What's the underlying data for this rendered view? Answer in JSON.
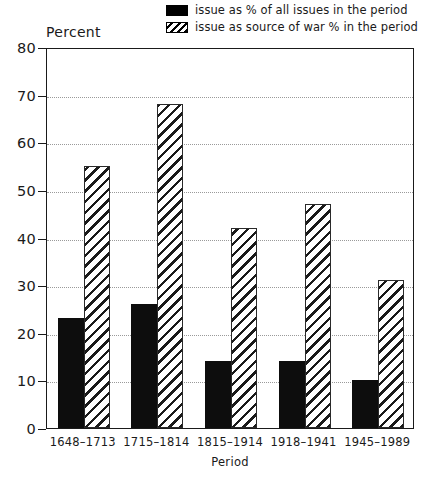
{
  "chart_data": {
    "type": "bar",
    "title": "",
    "ylabel": "Percent",
    "xlabel": "Period",
    "ylim": [
      0,
      80
    ],
    "yticks": [
      0,
      10,
      20,
      30,
      40,
      50,
      60,
      70,
      80
    ],
    "grid": true,
    "legend_position": "top-right",
    "categories": [
      "1648–1713",
      "1715–1814",
      "1815–1914",
      "1918–1941",
      "1945–1989"
    ],
    "series": [
      {
        "name": "issue as % of all issues in the period",
        "style": "solid-black",
        "values": [
          23,
          26,
          14,
          14,
          10
        ]
      },
      {
        "name": "issue as source of war % in the period",
        "style": "diagonal-hatch",
        "values": [
          55,
          68,
          42,
          47,
          31
        ]
      }
    ]
  },
  "legend": {
    "items": [
      {
        "label": "issue as % of all issues in the period",
        "swatch": "solid-black-swatch"
      },
      {
        "label": "issue as source of war % in the period",
        "swatch": "hatched-swatch"
      }
    ]
  },
  "axes": {
    "y_title": "Percent",
    "x_title": "Period"
  },
  "colors": {
    "series_1": "#0d0d0d",
    "series_2_hatch": "#1a1a1a",
    "axis": "#1a1a1a",
    "gridline": "#9a9a9a",
    "background": "#ffffff"
  }
}
